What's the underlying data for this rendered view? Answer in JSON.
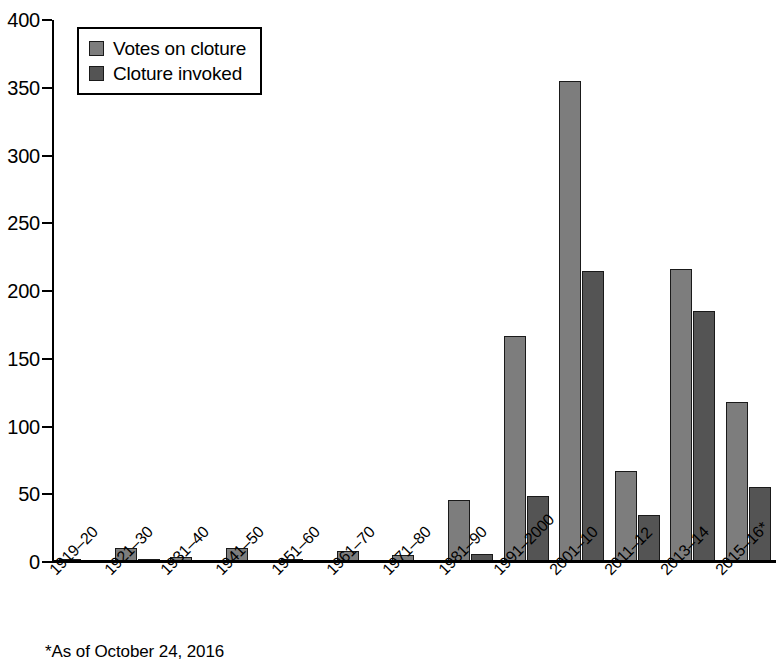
{
  "chart_data": {
    "type": "bar",
    "title": "",
    "subtitle": "",
    "xlabel": "",
    "ylabel": "",
    "ylim": [
      0,
      400
    ],
    "yticks": [
      0,
      50,
      100,
      150,
      200,
      250,
      300,
      350,
      400
    ],
    "grid": false,
    "legend_position": "top-left",
    "categories": [
      "1919–20",
      "1921–30",
      "1931–40",
      "1941–50",
      "1951–60",
      "1961–70",
      "1971–80",
      "1981–90",
      "1991–2000",
      "2001–10",
      "2011–12",
      "2013–14",
      "2015–16*"
    ],
    "series": [
      {
        "name": "Votes on cloture",
        "color": "#7d7d7d",
        "values": [
          2,
          10,
          4,
          10,
          2,
          8,
          5,
          46,
          167,
          355,
          67,
          216,
          118
        ]
      },
      {
        "name": "Cloture invoked",
        "color": "#545454",
        "values": [
          1,
          2,
          0,
          0,
          0,
          0,
          1,
          6,
          49,
          215,
          35,
          185,
          55
        ]
      }
    ],
    "annotations": [
      "*As of October 24, 2016"
    ]
  },
  "legend": {
    "items": [
      {
        "label": "Votes on cloture",
        "swatch": "light"
      },
      {
        "label": "Cloture invoked",
        "swatch": "dark"
      }
    ]
  },
  "footnote": {
    "text": "*As of October 24, 2016"
  }
}
